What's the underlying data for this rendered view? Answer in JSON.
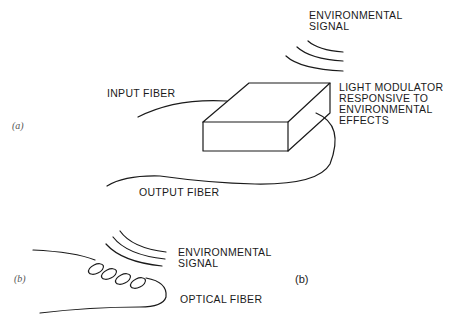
{
  "figure": {
    "panel_a": {
      "panel_label": "(a)",
      "labels": {
        "environmental_signal": [
          "ENVIRONMENTAL",
          "SIGNAL"
        ],
        "input_fiber": "INPUT FIBER",
        "light_modulator": [
          "LIGHT MODULATOR",
          "RESPONSIVE TO",
          "ENVIRONMENTAL",
          "EFFECTS"
        ],
        "output_fiber": "OUTPUT FIBER"
      }
    },
    "panel_b": {
      "panel_label": "(b)",
      "panel_label_bold": "(b)",
      "labels": {
        "environmental_signal": [
          "ENVIRONMENTAL",
          "SIGNAL"
        ],
        "optical_fiber": "OPTICAL FIBER"
      }
    }
  }
}
